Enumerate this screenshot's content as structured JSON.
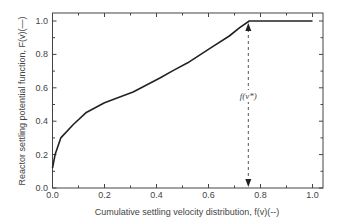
{
  "chart_data": {
    "type": "line",
    "title": "",
    "xlabel": "Cumulative settling velocity distribution, f(v)(--)",
    "ylabel": "Reactor settling potential function, F(v)(—)",
    "xlim": [
      0.0,
      1.0
    ],
    "ylim": [
      0.0,
      1.0
    ],
    "xticks": [
      "0.0",
      "0.2",
      "0.4",
      "0.6",
      "0.8",
      "1.0"
    ],
    "yticks": [
      "0.0",
      "0.2",
      "0.4",
      "0.6",
      "0.8",
      "1.0"
    ],
    "grid": false,
    "legend": null,
    "series": [
      {
        "name": "F(v)",
        "style": "solid",
        "color": "#222222",
        "x": [
          0.0,
          0.01,
          0.032,
          0.08,
          0.128,
          0.2,
          0.31,
          0.415,
          0.46,
          0.52,
          0.61,
          0.68,
          0.72,
          0.757,
          1.0
        ],
        "y": [
          0.12,
          0.2,
          0.3,
          0.38,
          0.45,
          0.51,
          0.575,
          0.66,
          0.7,
          0.75,
          0.84,
          0.91,
          0.96,
          1.0,
          1.0
        ]
      }
    ],
    "annotations": [
      {
        "text": "f(v*)",
        "type": "double-arrow-dashed",
        "x": 0.757,
        "y_from": 0.0,
        "y_to": 1.0
      }
    ]
  }
}
